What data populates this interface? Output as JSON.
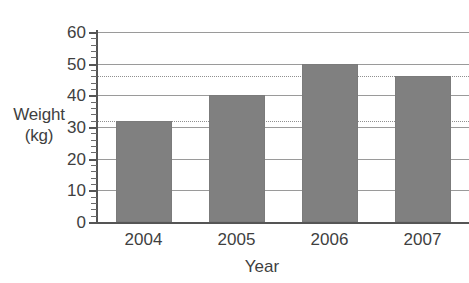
{
  "chart_data": {
    "type": "bar",
    "title": "",
    "categories": [
      "2004",
      "2005",
      "2006",
      "2007"
    ],
    "values": [
      32,
      40,
      50,
      46
    ],
    "series": [
      {
        "name": "Weight",
        "values": [
          32,
          40,
          50,
          46
        ]
      }
    ],
    "xlabel": "Year",
    "ylabel": "Weight (kg)",
    "ylabel_line1": "Weight",
    "ylabel_line2": "(kg)",
    "ylim": [
      0,
      60
    ],
    "ytick_labels": [
      "0",
      "10",
      "20",
      "30",
      "40",
      "50",
      "60"
    ],
    "ytick_values": [
      0,
      10,
      20,
      30,
      40,
      50,
      60
    ],
    "y_minor_tick_step": 2,
    "grid": "horizontal-solid-at-major-ticks",
    "legend": "none",
    "bar_color": "#808080",
    "gridline_color": "#9a9a9a",
    "axis_color": "#555555",
    "guide_lines": [
      {
        "value": 32,
        "style": "dotted",
        "color": "#8f8f8f"
      },
      {
        "value": 46,
        "style": "dotted",
        "color": "#8f8f8f"
      }
    ]
  }
}
